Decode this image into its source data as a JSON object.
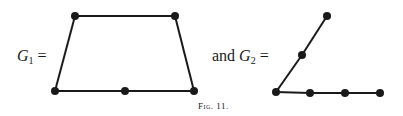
{
  "figure": {
    "caption": "Fig. 11.",
    "graphs": [
      {
        "name": "G1",
        "label_var": "G",
        "label_sub": "1",
        "label_prefix": "",
        "label_suffix": "=",
        "nodes": [
          {
            "id": "a",
            "x": 75,
            "y": 16
          },
          {
            "id": "b",
            "x": 175,
            "y": 16
          },
          {
            "id": "c",
            "x": 55,
            "y": 91
          },
          {
            "id": "d",
            "x": 125,
            "y": 91
          },
          {
            "id": "e",
            "x": 194,
            "y": 91
          }
        ],
        "edges": [
          [
            "a",
            "b"
          ],
          [
            "a",
            "c"
          ],
          [
            "b",
            "e"
          ],
          [
            "c",
            "d"
          ],
          [
            "d",
            "e"
          ]
        ]
      },
      {
        "name": "G2",
        "label_var": "G",
        "label_sub": "2",
        "label_prefix": "and",
        "label_suffix": "=",
        "nodes": [
          {
            "id": "p",
            "x": 327,
            "y": 16
          },
          {
            "id": "q",
            "x": 302,
            "y": 55
          },
          {
            "id": "r",
            "x": 276,
            "y": 92
          },
          {
            "id": "s",
            "x": 310,
            "y": 93
          },
          {
            "id": "t",
            "x": 345,
            "y": 93
          },
          {
            "id": "u",
            "x": 380,
            "y": 93
          }
        ],
        "edges": [
          [
            "p",
            "q"
          ],
          [
            "q",
            "r"
          ],
          [
            "r",
            "s"
          ],
          [
            "s",
            "t"
          ],
          [
            "t",
            "u"
          ]
        ]
      }
    ],
    "colors": {
      "ink": "#1a1a1a",
      "background": "#ffffff"
    }
  }
}
